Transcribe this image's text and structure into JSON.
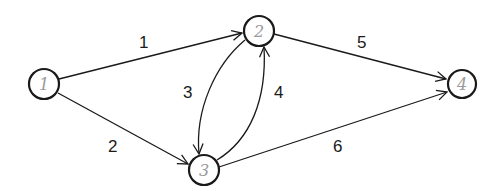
{
  "diagram": {
    "type": "directed-graph",
    "nodes": [
      {
        "id": "1",
        "label": "1",
        "cx": 44,
        "cy": 84,
        "r": 15
      },
      {
        "id": "2",
        "label": "2",
        "cx": 259,
        "cy": 31,
        "r": 15
      },
      {
        "id": "3",
        "label": "3",
        "cx": 204,
        "cy": 170,
        "r": 15
      },
      {
        "id": "4",
        "label": "4",
        "cx": 462,
        "cy": 84,
        "r": 14
      }
    ],
    "edges": [
      {
        "label": "1",
        "from": "1",
        "to": "2"
      },
      {
        "label": "2",
        "from": "1",
        "to": "3"
      },
      {
        "label": "3",
        "from": "2",
        "to": "3"
      },
      {
        "label": "4",
        "from": "3",
        "to": "2"
      },
      {
        "label": "5",
        "from": "2",
        "to": "4"
      },
      {
        "label": "6",
        "from": "3",
        "to": "4"
      }
    ],
    "colors": {
      "stroke": "#1a1a1a",
      "node_text": "#9a9a9a",
      "background": "#ffffff"
    }
  }
}
